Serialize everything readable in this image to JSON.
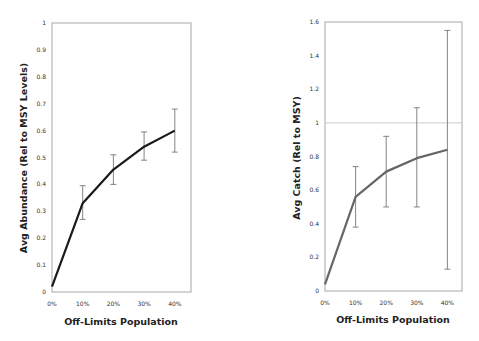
{
  "chart_data": [
    {
      "type": "line",
      "title": "",
      "xlabel": "Off-Limits Population",
      "ylabel": "Avg Abundance (Rel to MSY Levels)",
      "categories": [
        "0%",
        "10%",
        "20%",
        "30%",
        "40%"
      ],
      "series": [
        {
          "name": "Avg Abundance",
          "values": [
            0.02,
            0.33,
            0.455,
            0.54,
            0.6
          ],
          "error_low": [
            null,
            0.27,
            0.4,
            0.49,
            0.52
          ],
          "error_high": [
            null,
            0.395,
            0.51,
            0.595,
            0.68
          ],
          "color": "#1a1a1a"
        }
      ],
      "ylim": [
        0,
        1
      ],
      "yticks": [
        "0",
        "0.1",
        "0.2",
        "0.3",
        "0.4",
        "0.5",
        "0.6",
        "0.7",
        "0.8",
        "0.9",
        "1"
      ],
      "grid": false,
      "legend": "none"
    },
    {
      "type": "line",
      "title": "",
      "xlabel": "Off-Limits Population",
      "ylabel": "Avg Catch (Rel to MSY)",
      "categories": [
        "0%",
        "10%",
        "20%",
        "30%",
        "40%"
      ],
      "series": [
        {
          "name": "Avg Catch",
          "values": [
            0.04,
            0.56,
            0.71,
            0.79,
            0.84
          ],
          "error_low": [
            null,
            0.38,
            0.5,
            0.5,
            0.13
          ],
          "error_high": [
            null,
            0.74,
            0.92,
            1.09,
            1.55
          ],
          "color": "#666666"
        }
      ],
      "reference_line": {
        "y": 1,
        "color": "#cccccc"
      },
      "ylim": [
        0,
        1.6
      ],
      "yticks": [
        "0",
        "0.2",
        "0.4",
        "0.6",
        "0.8",
        "1",
        "1.2",
        "1.4",
        "1.6"
      ],
      "grid": false,
      "legend": "none"
    }
  ]
}
